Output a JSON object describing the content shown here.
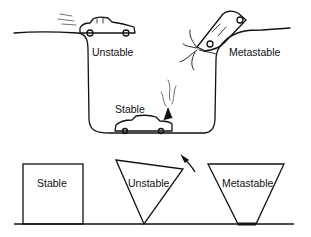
{
  "top_scene": {
    "labels": {
      "unstable": "Unstable",
      "stable": "Stable",
      "metastable": "Metastable"
    }
  },
  "bottom_scene": {
    "labels": {
      "stable": "Stable",
      "unstable": "Unstable",
      "metastable": "Metastable"
    }
  },
  "colors": {
    "ink": "#111111",
    "background": "#ffffff"
  }
}
